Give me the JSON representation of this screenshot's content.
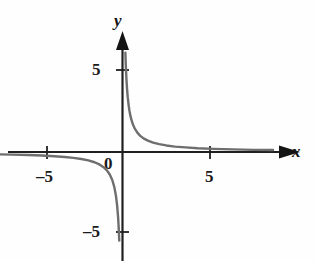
{
  "chart_data": {
    "type": "line",
    "title": "",
    "subtitle": "",
    "function": "y = 1/x",
    "xlabel": "x",
    "ylabel": "y",
    "xlim": [
      -7.2,
      8.8
    ],
    "ylim": [
      -6.8,
      7.0
    ],
    "grid": false,
    "legend": null,
    "axis_arrows": {
      "x_positive": true,
      "y_positive": true
    },
    "xticks": [
      -5,
      5
    ],
    "xtick_labels": [
      "–5",
      "5"
    ],
    "yticks": [
      5,
      -5
    ],
    "ytick_labels": [
      "5",
      "–5"
    ],
    "origin_label": "0",
    "series": [
      {
        "name": "y = 1/x (branch 1, x > 0)",
        "x": [
          0.165,
          0.18,
          0.2,
          0.23,
          0.26,
          0.3,
          0.35,
          0.4,
          0.46,
          0.53,
          0.62,
          0.72,
          0.85,
          1.0,
          1.2,
          1.45,
          1.75,
          2.1,
          2.5,
          3.0,
          3.6,
          4.3,
          5.2,
          6.3,
          7.5,
          8.6
        ],
        "y": [
          6.06,
          5.56,
          5.0,
          4.35,
          3.85,
          3.33,
          2.86,
          2.5,
          2.17,
          1.89,
          1.61,
          1.39,
          1.18,
          1.0,
          0.83,
          0.69,
          0.57,
          0.48,
          0.4,
          0.33,
          0.28,
          0.23,
          0.19,
          0.16,
          0.13,
          0.12
        ]
      },
      {
        "name": "y = 1/x (branch 2, x < 0)",
        "x": [
          -7.2,
          -6.3,
          -5.4,
          -4.6,
          -3.9,
          -3.3,
          -2.8,
          -2.35,
          -1.95,
          -1.6,
          -1.32,
          -1.08,
          -0.88,
          -0.72,
          -0.58,
          -0.47,
          -0.38,
          -0.31,
          -0.25,
          -0.21,
          -0.185
        ],
        "y": [
          -0.139,
          -0.159,
          -0.185,
          -0.217,
          -0.256,
          -0.303,
          -0.357,
          -0.426,
          -0.513,
          -0.625,
          -0.758,
          -0.926,
          -1.136,
          -1.389,
          -1.724,
          -2.128,
          -2.632,
          -3.226,
          -4.0,
          -4.762,
          -5.405
        ]
      }
    ],
    "colors": {
      "curve": "#6e6e6e",
      "axis": "#1f1f1f",
      "background": "#fefefe",
      "text": "#1a1a1a"
    }
  }
}
